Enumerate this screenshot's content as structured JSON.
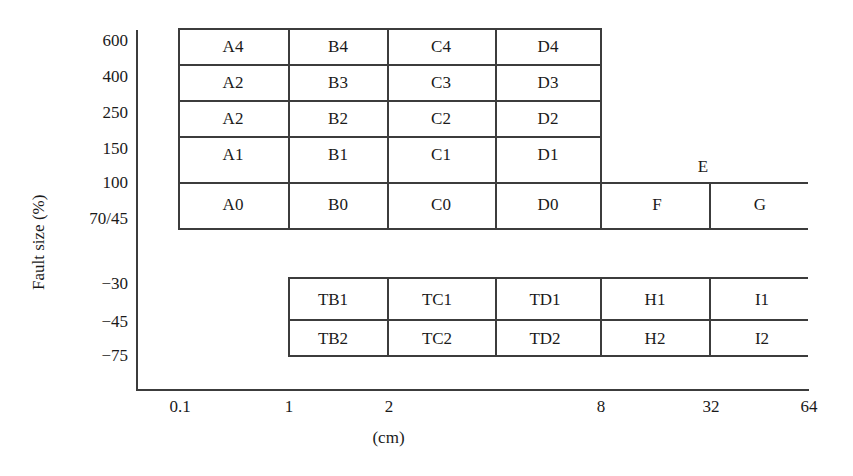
{
  "chart_data": {
    "type": "table",
    "title": "",
    "xlabel": "(cm)",
    "ylabel": "Fault size (%)",
    "x_ticks": [
      "0.1",
      "1",
      "2",
      "8",
      "32",
      "64"
    ],
    "y_ticks": [
      "600",
      "400",
      "250",
      "150",
      "100",
      "70/45",
      "-30",
      "-45",
      "-75"
    ],
    "grid": true,
    "legend": "none",
    "upper_block": {
      "row_bounds_percent": [
        "600",
        "400",
        "250",
        "150",
        "100",
        "70/45"
      ],
      "column_bounds_cm": [
        "0.1",
        "1",
        "2",
        "8",
        "32",
        "64"
      ],
      "rows": [
        {
          "band": "400-600",
          "cells": [
            "A4",
            "B4",
            "C4",
            "D4"
          ]
        },
        {
          "band": "250-400",
          "cells": [
            "A2",
            "B3",
            "C3",
            "D3"
          ]
        },
        {
          "band": "150-250",
          "cells": [
            "A2",
            "B2",
            "C2",
            "D2"
          ]
        },
        {
          "band": "100-150",
          "cells": [
            "A1",
            "B1",
            "C1",
            "D1"
          ]
        },
        {
          "band": "70/45-100",
          "cells": [
            "A0",
            "B0",
            "C0",
            "D0"
          ]
        }
      ],
      "open_region_label": "E",
      "bottom_right_cells": [
        "F",
        "G"
      ]
    },
    "lower_block": {
      "row_bounds_percent": [
        "-30",
        "-45",
        "-75"
      ],
      "rows": [
        {
          "band": "-45 to -30",
          "cells": [
            "TB1",
            "TC1",
            "TD1",
            "H1",
            "I1"
          ]
        },
        {
          "band": "-75 to -45",
          "cells": [
            "TB2",
            "TC2",
            "TD2",
            "H2",
            "I2"
          ]
        }
      ]
    }
  },
  "axis": {
    "y_title": "Fault size (%)",
    "x_title": "(cm)",
    "y_labels": [
      {
        "text": "600",
        "y": 40
      },
      {
        "text": "400",
        "y": 76
      },
      {
        "text": "250",
        "y": 112
      },
      {
        "text": "150",
        "y": 148
      },
      {
        "text": "100",
        "y": 182
      },
      {
        "text": "70/45",
        "y": 218
      },
      {
        "text": "−30",
        "y": 283
      },
      {
        "text": "−45",
        "y": 321
      },
      {
        "text": "−75",
        "y": 355
      }
    ],
    "x_labels": [
      {
        "text": "0.1",
        "x": 180
      },
      {
        "text": "1",
        "x": 289
      },
      {
        "text": "2",
        "x": 389
      },
      {
        "text": "8",
        "x": 601
      },
      {
        "text": "32",
        "x": 711
      },
      {
        "text": "64",
        "x": 809
      }
    ]
  },
  "upper_cells": [
    {
      "text": "A4",
      "x": 233,
      "y": 46
    },
    {
      "text": "B4",
      "x": 338,
      "y": 46
    },
    {
      "text": "C4",
      "x": 441,
      "y": 46
    },
    {
      "text": "D4",
      "x": 548,
      "y": 46
    },
    {
      "text": "A2",
      "x": 233,
      "y": 82
    },
    {
      "text": "B3",
      "x": 338,
      "y": 82
    },
    {
      "text": "C3",
      "x": 441,
      "y": 82
    },
    {
      "text": "D3",
      "x": 548,
      "y": 82
    },
    {
      "text": "A2",
      "x": 233,
      "y": 118
    },
    {
      "text": "B2",
      "x": 338,
      "y": 118
    },
    {
      "text": "C2",
      "x": 441,
      "y": 118
    },
    {
      "text": "D2",
      "x": 548,
      "y": 118
    },
    {
      "text": "A1",
      "x": 233,
      "y": 154
    },
    {
      "text": "B1",
      "x": 338,
      "y": 154
    },
    {
      "text": "C1",
      "x": 441,
      "y": 154
    },
    {
      "text": "D1",
      "x": 548,
      "y": 154
    },
    {
      "text": "A0",
      "x": 233,
      "y": 204
    },
    {
      "text": "B0",
      "x": 338,
      "y": 204
    },
    {
      "text": "C0",
      "x": 441,
      "y": 204
    },
    {
      "text": "D0",
      "x": 548,
      "y": 204
    },
    {
      "text": "E",
      "x": 703,
      "y": 166
    },
    {
      "text": "F",
      "x": 657,
      "y": 204
    },
    {
      "text": "G",
      "x": 760,
      "y": 204
    }
  ],
  "lower_cells": [
    {
      "text": "TB1",
      "x": 333,
      "y": 299
    },
    {
      "text": "TC1",
      "x": 437,
      "y": 299
    },
    {
      "text": "TD1",
      "x": 545,
      "y": 299
    },
    {
      "text": "H1",
      "x": 655,
      "y": 299
    },
    {
      "text": "I1",
      "x": 762,
      "y": 299
    },
    {
      "text": "TB2",
      "x": 333,
      "y": 338
    },
    {
      "text": "TC2",
      "x": 437,
      "y": 338
    },
    {
      "text": "TD2",
      "x": 545,
      "y": 338
    },
    {
      "text": "H2",
      "x": 655,
      "y": 338
    },
    {
      "text": "I2",
      "x": 762,
      "y": 338
    }
  ],
  "geometry": {
    "upper_h_lines": [
      {
        "x": 178,
        "y": 28,
        "w": 422
      },
      {
        "x": 178,
        "y": 64,
        "w": 422
      },
      {
        "x": 178,
        "y": 100,
        "w": 422
      },
      {
        "x": 178,
        "y": 136,
        "w": 422
      },
      {
        "x": 178,
        "y": 182,
        "w": 630
      },
      {
        "x": 178,
        "y": 228,
        "w": 630
      }
    ],
    "upper_v_lines": [
      {
        "x": 178,
        "y": 28,
        "h": 200
      },
      {
        "x": 288,
        "y": 28,
        "h": 200
      },
      {
        "x": 387,
        "y": 28,
        "h": 200
      },
      {
        "x": 495,
        "y": 28,
        "h": 200
      },
      {
        "x": 600,
        "y": 28,
        "h": 200
      },
      {
        "x": 709,
        "y": 182,
        "h": 46
      }
    ],
    "lower_h_lines": [
      {
        "x": 288,
        "y": 277,
        "w": 520
      },
      {
        "x": 288,
        "y": 319,
        "w": 520
      },
      {
        "x": 288,
        "y": 355,
        "w": 520
      }
    ],
    "lower_v_lines": [
      {
        "x": 288,
        "y": 277,
        "h": 78
      },
      {
        "x": 387,
        "y": 277,
        "h": 78
      },
      {
        "x": 495,
        "y": 277,
        "h": 78
      },
      {
        "x": 600,
        "y": 277,
        "h": 78
      },
      {
        "x": 709,
        "y": 277,
        "h": 78
      }
    ]
  },
  "colors": {
    "line": "#3c3c3c",
    "text": "#1a1a1a",
    "background": "#ffffff"
  }
}
